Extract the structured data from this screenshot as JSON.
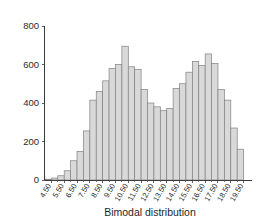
{
  "chart_data": {
    "type": "bar",
    "title": "",
    "subtitle": "",
    "xlabel": "Bimodal distribution",
    "ylabel": "",
    "grid": false,
    "legend": false,
    "bin_width": 0.5,
    "xlim": [
      4.0,
      20.0
    ],
    "ylim": [
      0,
      800
    ],
    "y_ticks": [
      0,
      200,
      400,
      600,
      800
    ],
    "y_tick_labels": [
      "0",
      "200",
      "400",
      "600",
      "800"
    ],
    "x_tick_labels": [
      "4.50",
      "5.50",
      "6.50",
      "7.50",
      "8.50",
      "9.50",
      "10.50",
      "11.50",
      "12.50",
      "13.50",
      "14.50",
      "15.50",
      "16.50",
      "17.50",
      "18.50",
      "19.50"
    ],
    "x_tick_values": [
      4.5,
      5.5,
      6.5,
      7.5,
      8.5,
      9.5,
      10.5,
      11.5,
      12.5,
      13.5,
      14.5,
      15.5,
      16.5,
      17.5,
      18.5,
      19.5
    ],
    "categories": [
      "4.25",
      "4.75",
      "5.25",
      "5.75",
      "6.25",
      "6.75",
      "7.25",
      "7.75",
      "8.25",
      "8.75",
      "9.25",
      "9.75",
      "10.25",
      "10.75",
      "11.25",
      "11.75",
      "12.25",
      "12.75",
      "13.25",
      "13.75",
      "14.25",
      "14.75",
      "15.25",
      "15.75",
      "16.25",
      "16.75",
      "17.25",
      "17.75",
      "18.25",
      "18.75",
      "19.25"
    ],
    "bin_centers": [
      4.25,
      4.75,
      5.25,
      5.75,
      6.25,
      6.75,
      7.25,
      7.75,
      8.25,
      8.75,
      9.25,
      9.75,
      10.25,
      10.75,
      11.25,
      11.75,
      12.25,
      12.75,
      13.25,
      13.75,
      14.25,
      14.75,
      15.25,
      15.75,
      16.25,
      16.75,
      17.25,
      17.75,
      18.25,
      18.75,
      19.25
    ],
    "values": [
      4,
      10,
      22,
      48,
      100,
      148,
      255,
      415,
      460,
      515,
      580,
      600,
      695,
      588,
      575,
      470,
      400,
      380,
      360,
      372,
      475,
      500,
      560,
      615,
      595,
      655,
      605,
      470,
      415,
      270,
      160
    ],
    "accent_color": "#d9d9d9",
    "bar_edge_color": "#808080",
    "axis_color": "#3a3a3a",
    "text_color": "#2b2b2b"
  }
}
